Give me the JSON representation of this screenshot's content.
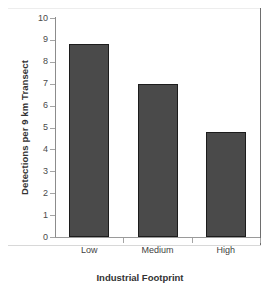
{
  "chart_data": {
    "type": "bar",
    "title": "",
    "categories": [
      "Low",
      "Medium",
      "High"
    ],
    "values": [
      8.8,
      7.0,
      4.8
    ],
    "xlabel": "Industrial Footprint",
    "ylabel": "Detections per 9 km Transect",
    "ylim": [
      0,
      10
    ],
    "ytick_labels": [
      "10",
      "9",
      "8",
      "7",
      "6",
      "5",
      "4",
      "3",
      "2",
      "1",
      "0"
    ],
    "ytick_values": [
      10,
      9,
      8,
      7,
      6,
      5,
      4,
      3,
      2,
      1,
      0
    ],
    "grid": false,
    "legend": false,
    "bar_color": "#4a4a4a",
    "bar_edge_color": "#1c1c1c",
    "axis_color": "#8c8c8c",
    "background": "#ffffff"
  }
}
